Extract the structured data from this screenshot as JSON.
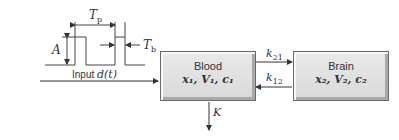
{
  "diagram": {
    "pulse": {
      "period_label": "T",
      "period_sub": "p",
      "width_label": "T",
      "width_sub": "b",
      "amplitude_label": "A"
    },
    "input_label_prefix": "Input ",
    "input_label_func": "d(t)",
    "blood": {
      "title": "Blood",
      "vars": "x₁, V₁, c₁"
    },
    "brain": {
      "title": "Brain",
      "vars": "x₂, V₂, c₂"
    },
    "k21": {
      "base": "k",
      "sub": "21"
    },
    "k12": {
      "base": "k",
      "sub": "12"
    },
    "elimination": "K",
    "colors": {
      "line": "#333333",
      "box_fill": "#e0e0e0",
      "box_border": "#6a6a6a"
    }
  }
}
